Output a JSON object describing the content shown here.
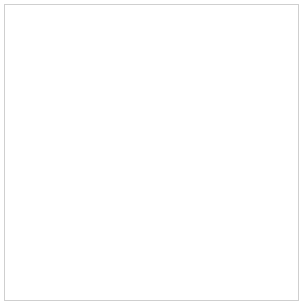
{
  "chart_data": {
    "type": "scatter",
    "title": "",
    "xlabel": "Cin ml/min/1.73 m2",
    "xlabel_main": "Cin ml/min/1.73 m",
    "xlabel_sup": "2",
    "ylabel": "serum creatinine (mg/dl)",
    "xlim": [
      0,
      190
    ],
    "ylim": [
      0,
      9.2
    ],
    "xticks": [
      0,
      20,
      40,
      60,
      80,
      100,
      120,
      140,
      160,
      180
    ],
    "xtick_labels": [
      "0",
      "20",
      "40",
      "60",
      "80",
      "100",
      "120",
      "140",
      "160",
      "180"
    ],
    "yticks": [
      0,
      1,
      2,
      3,
      4,
      5,
      6,
      7,
      8
    ],
    "ytick_labels": [
      "0",
      "1.0",
      "2.0",
      "3.0",
      "4.0",
      "5.0",
      "6.0",
      "7.0",
      "8.0"
    ],
    "grid": false,
    "legend_position": "none",
    "colors": {
      "scatter_point": "#2f3a80",
      "curve": "#6a74b4",
      "curve_marker_edge": "#5a64aa",
      "curve_marker_fill": "#ffffff",
      "reference_line": "#333333",
      "axis": "#555555",
      "frame": "#cfcfcf",
      "text": "#1a1a1a"
    },
    "annotations": [
      {
        "name": "creatinine-filtration-label",
        "text": "creatinine filtration",
        "x_px": 88,
        "y_px": 74,
        "leader_from": [
          86,
          78
        ],
        "leader_to": [
          69,
          95
        ]
      }
    ],
    "reference_line": {
      "name": "upper-normal-limit",
      "style": "dashed",
      "y": 1.4,
      "x_start": 0,
      "x_end": 190
    },
    "series": [
      {
        "name": "creatinine filtration",
        "type": "line",
        "style": "solid",
        "marker": "open-circle",
        "marker_x": [
          20,
          30,
          40,
          60,
          80,
          120
        ],
        "marker_y": [
          6.0,
          4.0,
          2.95,
          2.0,
          1.55,
          1.1
        ],
        "x": [
          12.5,
          13.5,
          15,
          17,
          19,
          20,
          22,
          25,
          28,
          30,
          33,
          36,
          40,
          45,
          50,
          55,
          60,
          68,
          75,
          80,
          90,
          100,
          110,
          120,
          130,
          140
        ],
        "y": [
          9.3,
          8.7,
          7.9,
          6.95,
          6.25,
          6.0,
          5.45,
          4.8,
          4.25,
          4.0,
          3.62,
          3.32,
          2.95,
          2.62,
          2.38,
          2.18,
          2.0,
          1.8,
          1.65,
          1.55,
          1.4,
          1.28,
          1.18,
          1.1,
          1.02,
          0.96
        ]
      },
      {
        "name": "patients",
        "type": "scatter",
        "marker": "filled-square",
        "points": [
          [
            2,
            9.1
          ],
          [
            3,
            8.0
          ],
          [
            1,
            7.6
          ],
          [
            6,
            8.25
          ],
          [
            7,
            6.6
          ],
          [
            10,
            6.45
          ],
          [
            4,
            5.4
          ],
          [
            3,
            5.15
          ],
          [
            10,
            5.6
          ],
          [
            12,
            4.85
          ],
          [
            13,
            4.7
          ],
          [
            14,
            4.65
          ],
          [
            1,
            4.4
          ],
          [
            3,
            4.15
          ],
          [
            9,
            4.05
          ],
          [
            11,
            3.85
          ],
          [
            16,
            3.95
          ],
          [
            18,
            3.75
          ],
          [
            14,
            3.45
          ],
          [
            17,
            3.4
          ],
          [
            19,
            3.4
          ],
          [
            20,
            3.45
          ],
          [
            8,
            3.05
          ],
          [
            1,
            2.45
          ],
          [
            12,
            2.75
          ],
          [
            14,
            2.62
          ],
          [
            17,
            2.7
          ],
          [
            21,
            2.68
          ],
          [
            24,
            2.7
          ],
          [
            30,
            2.62
          ],
          [
            36,
            2.5
          ],
          [
            9,
            2.05
          ],
          [
            13,
            2.25
          ],
          [
            16,
            2.2
          ],
          [
            19,
            2.15
          ],
          [
            21,
            2.32
          ],
          [
            23,
            2.1
          ],
          [
            26,
            2.3
          ],
          [
            28,
            2.0
          ],
          [
            31,
            2.18
          ],
          [
            33,
            1.95
          ],
          [
            35,
            2.2
          ],
          [
            38,
            2.05
          ],
          [
            41,
            2.35
          ],
          [
            44,
            1.92
          ],
          [
            47,
            2.05
          ],
          [
            52,
            1.9
          ],
          [
            5,
            1.95
          ],
          [
            12,
            1.62
          ],
          [
            15,
            1.55
          ],
          [
            17,
            1.7
          ],
          [
            19,
            1.5
          ],
          [
            22,
            1.62
          ],
          [
            24,
            1.45
          ],
          [
            26,
            1.72
          ],
          [
            27,
            1.5
          ],
          [
            29,
            1.58
          ],
          [
            31,
            1.42
          ],
          [
            32,
            1.68
          ],
          [
            34,
            1.5
          ],
          [
            36,
            1.6
          ],
          [
            37,
            1.38
          ],
          [
            39,
            1.55
          ],
          [
            41,
            1.45
          ],
          [
            43,
            1.62
          ],
          [
            45,
            1.35
          ],
          [
            47,
            1.52
          ],
          [
            49,
            1.42
          ],
          [
            51,
            1.58
          ],
          [
            53,
            1.3
          ],
          [
            55,
            1.48
          ],
          [
            57,
            1.38
          ],
          [
            59,
            1.55
          ],
          [
            61,
            1.28
          ],
          [
            63,
            1.42
          ],
          [
            65,
            1.5
          ],
          [
            67,
            1.35
          ],
          [
            69,
            1.45
          ],
          [
            71,
            1.3
          ],
          [
            73,
            1.4
          ],
          [
            75,
            1.48
          ],
          [
            77,
            1.32
          ],
          [
            79,
            1.42
          ],
          [
            81,
            1.25
          ],
          [
            83,
            1.38
          ],
          [
            85,
            1.3
          ],
          [
            87,
            1.42
          ],
          [
            89,
            1.22
          ],
          [
            91,
            1.35
          ],
          [
            18,
            1.25
          ],
          [
            20,
            1.15
          ],
          [
            23,
            1.22
          ],
          [
            25,
            1.05
          ],
          [
            28,
            1.18
          ],
          [
            30,
            1.08
          ],
          [
            33,
            1.2
          ],
          [
            35,
            1.0
          ],
          [
            38,
            1.15
          ],
          [
            40,
            1.05
          ],
          [
            42,
            1.22
          ],
          [
            44,
            1.08
          ],
          [
            46,
            0.95
          ],
          [
            48,
            1.12
          ],
          [
            50,
            1.02
          ],
          [
            52,
            1.18
          ],
          [
            54,
            0.92
          ],
          [
            56,
            1.08
          ],
          [
            58,
            1.0
          ],
          [
            60,
            1.15
          ],
          [
            62,
            0.98
          ],
          [
            64,
            1.1
          ],
          [
            66,
            1.02
          ],
          [
            68,
            0.9
          ],
          [
            70,
            1.12
          ],
          [
            72,
            0.95
          ],
          [
            74,
            1.05
          ],
          [
            76,
            0.88
          ],
          [
            78,
            1.0
          ],
          [
            80,
            0.92
          ],
          [
            82,
            1.08
          ],
          [
            84,
            0.85
          ],
          [
            86,
            0.98
          ],
          [
            88,
            0.9
          ],
          [
            90,
            1.02
          ],
          [
            92,
            0.78
          ],
          [
            94,
            0.92
          ],
          [
            96,
            0.85
          ],
          [
            98,
            0.95
          ],
          [
            100,
            0.8
          ],
          [
            102,
            0.9
          ],
          [
            104,
            0.75
          ],
          [
            106,
            0.88
          ],
          [
            108,
            0.82
          ],
          [
            110,
            0.95
          ],
          [
            112,
            1.15
          ],
          [
            114,
            0.78
          ],
          [
            116,
            0.9
          ],
          [
            118,
            1.05
          ],
          [
            120,
            0.85
          ],
          [
            124,
            0.72
          ],
          [
            128,
            0.95
          ],
          [
            132,
            0.68
          ],
          [
            136,
            0.75
          ],
          [
            140,
            0.72
          ],
          [
            122,
            1.2
          ],
          [
            152,
            1.22
          ],
          [
            163,
            0.72
          ],
          [
            168,
            0.72
          ],
          [
            180,
            1.02
          ],
          [
            44,
            0.68
          ],
          [
            50,
            0.72
          ],
          [
            56,
            0.66
          ],
          [
            62,
            0.7
          ],
          [
            88,
            0.62
          ],
          [
            93,
            0.65
          ],
          [
            97,
            0.7
          ],
          [
            101,
            0.68
          ],
          [
            73,
            0.75
          ],
          [
            67,
            0.78
          ]
        ]
      }
    ]
  }
}
